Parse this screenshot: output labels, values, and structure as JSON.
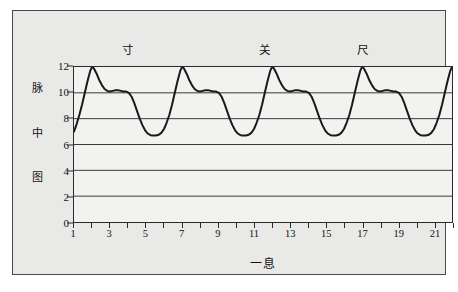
{
  "chart_data": {
    "type": "line",
    "title": "",
    "subtitle": "",
    "xlabel": "一息",
    "ylabel": "脉中图",
    "ylabel_chars": [
      "脉",
      "中",
      "图"
    ],
    "xlim": [
      1,
      22
    ],
    "ylim": [
      0,
      12
    ],
    "yticks": [
      0,
      2,
      4,
      6,
      8,
      10,
      12
    ],
    "ytick_labels": [
      "0",
      "2",
      "4",
      "6",
      "8",
      "10",
      "12"
    ],
    "xticks": [
      1,
      3,
      5,
      7,
      9,
      11,
      13,
      15,
      17,
      19,
      21
    ],
    "xtick_labels": [
      "1",
      "3",
      "5",
      "7",
      "9",
      "11",
      "13",
      "15",
      "17",
      "19",
      "21"
    ],
    "xticks_minor": [
      2,
      4,
      6,
      8,
      10,
      12,
      14,
      16,
      18,
      20,
      22
    ],
    "grid": "horizontal",
    "legend": "none",
    "line_color": "#1a1a1a",
    "line_width": 2.0,
    "plot_background": "#f2f2f0",
    "panel_background": "#e9e9e7",
    "axis_color": "#2b2b2b",
    "grid_color": "#3a3a3a",
    "period": 5,
    "peak_value": 12,
    "shoulder_value": 10.1,
    "trough_value": 6.7,
    "start_value": 7.0,
    "annotations": [
      {
        "text": "寸",
        "x": 4.0,
        "y": 12.9
      },
      {
        "text": "关",
        "x": 11.6,
        "y": 12.9
      },
      {
        "text": "尺",
        "x": 17.0,
        "y": 12.9
      }
    ],
    "series": [
      {
        "name": "pulse",
        "x": [
          1.0,
          1.15,
          1.3,
          1.45,
          1.6,
          1.75,
          1.9,
          2.0,
          2.1,
          2.25,
          2.4,
          2.55,
          2.7,
          2.85,
          3.0,
          3.15,
          3.3,
          3.45,
          3.6,
          3.75,
          3.9,
          4.05,
          4.2,
          4.35,
          4.5,
          4.65,
          4.8,
          4.95,
          5.1,
          5.25,
          5.4,
          5.55,
          5.7,
          5.85,
          6.0,
          6.15,
          6.3,
          6.45,
          6.6,
          6.75,
          6.9,
          7.0,
          7.1,
          7.25,
          7.4,
          7.55,
          7.7,
          7.85,
          8.0,
          8.15,
          8.3,
          8.45,
          8.6,
          8.75,
          8.9,
          9.05,
          9.2,
          9.35,
          9.5,
          9.65,
          9.8,
          9.95,
          10.1,
          10.25,
          10.4,
          10.55,
          10.7,
          10.85,
          11.0,
          11.15,
          11.3,
          11.45,
          11.6,
          11.75,
          11.9,
          12.0,
          12.1,
          12.25,
          12.4,
          12.55,
          12.7,
          12.85,
          13.0,
          13.15,
          13.3,
          13.45,
          13.6,
          13.75,
          13.9,
          14.05,
          14.2,
          14.35,
          14.5,
          14.65,
          14.8,
          14.95,
          15.1,
          15.25,
          15.4,
          15.55,
          15.7,
          15.85,
          16.0,
          16.15,
          16.3,
          16.45,
          16.6,
          16.75,
          16.9,
          17.0,
          17.1,
          17.25,
          17.4,
          17.55,
          17.7,
          17.85,
          18.0,
          18.15,
          18.3,
          18.45,
          18.6,
          18.75,
          18.9,
          19.05,
          19.2,
          19.35,
          19.5,
          19.65,
          19.8,
          19.95,
          20.1,
          20.25,
          20.4,
          20.55,
          20.7,
          20.85,
          21.0,
          21.15,
          21.3,
          21.45,
          21.6,
          21.75,
          21.9,
          22.0
        ],
        "y": [
          7.0,
          7.6,
          8.3,
          9.1,
          10.0,
          10.9,
          11.7,
          12.0,
          11.9,
          11.5,
          11.0,
          10.6,
          10.3,
          10.15,
          10.1,
          10.15,
          10.2,
          10.2,
          10.15,
          10.1,
          10.1,
          10.0,
          9.7,
          9.2,
          8.6,
          8.0,
          7.5,
          7.1,
          6.85,
          6.72,
          6.7,
          6.7,
          6.75,
          6.9,
          7.2,
          7.7,
          8.3,
          9.1,
          10.0,
          10.9,
          11.7,
          12.0,
          11.9,
          11.5,
          11.0,
          10.6,
          10.3,
          10.15,
          10.1,
          10.15,
          10.2,
          10.2,
          10.15,
          10.1,
          10.1,
          10.0,
          9.7,
          9.2,
          8.6,
          8.0,
          7.5,
          7.1,
          6.85,
          6.72,
          6.7,
          6.7,
          6.75,
          6.9,
          7.2,
          7.7,
          8.3,
          9.1,
          10.0,
          10.9,
          11.7,
          12.0,
          11.9,
          11.5,
          11.0,
          10.6,
          10.3,
          10.15,
          10.1,
          10.15,
          10.2,
          10.2,
          10.15,
          10.1,
          10.1,
          10.0,
          9.7,
          9.2,
          8.6,
          8.0,
          7.5,
          7.1,
          6.85,
          6.72,
          6.7,
          6.7,
          6.75,
          6.9,
          7.2,
          7.7,
          8.3,
          9.1,
          10.0,
          10.9,
          11.7,
          12.0,
          11.9,
          11.5,
          11.0,
          10.6,
          10.3,
          10.15,
          10.1,
          10.15,
          10.2,
          10.2,
          10.15,
          10.1,
          10.1,
          10.0,
          9.7,
          9.2,
          8.6,
          8.0,
          7.5,
          7.1,
          6.85,
          6.72,
          6.7,
          6.7,
          6.75,
          6.9,
          7.2,
          7.7,
          8.3,
          9.1,
          10.0,
          10.9,
          11.7,
          12.0
        ]
      }
    ]
  }
}
